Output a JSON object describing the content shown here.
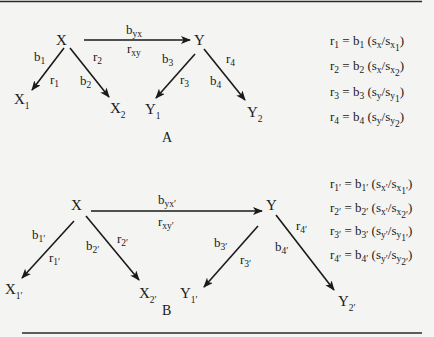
{
  "panels": {
    "A": {
      "caption": "A",
      "nodes": {
        "X": {
          "base": "X",
          "sub": ""
        },
        "Y": {
          "base": "Y",
          "sub": ""
        },
        "X1": {
          "base": "X",
          "sub": "1"
        },
        "X2": {
          "base": "X",
          "sub": "2"
        },
        "Y1": {
          "base": "Y",
          "sub": "1"
        },
        "Y2": {
          "base": "Y",
          "sub": "2"
        }
      },
      "edges": {
        "byx": {
          "base": "b",
          "sub": "yx"
        },
        "rxy": {
          "base": "r",
          "sub": "xy"
        },
        "b1": {
          "base": "b",
          "sub": "1"
        },
        "r1": {
          "base": "r",
          "sub": "1"
        },
        "b2": {
          "base": "b",
          "sub": "2"
        },
        "r2": {
          "base": "r",
          "sub": "2"
        },
        "b3": {
          "base": "b",
          "sub": "3"
        },
        "r3": {
          "base": "r",
          "sub": "3"
        },
        "b4": {
          "base": "b",
          "sub": "4"
        },
        "r4": {
          "base": "r",
          "sub": "4"
        }
      },
      "equations": [
        {
          "r": "r",
          "rs": "1",
          "eq": " = b",
          "bs": "1",
          "open": " (s",
          "ns": "x",
          "slash": "/s",
          "ds": "x",
          "dss": "1",
          "close": ")"
        },
        {
          "r": "r",
          "rs": "2",
          "eq": " = b",
          "bs": "2",
          "open": " (s",
          "ns": "x",
          "slash": "/s",
          "ds": "x",
          "dss": "2",
          "close": ")"
        },
        {
          "r": "r",
          "rs": "3",
          "eq": " = b",
          "bs": "3",
          "open": " (s",
          "ns": "y",
          "slash": "/s",
          "ds": "y",
          "dss": "1",
          "close": ")"
        },
        {
          "r": "r",
          "rs": "4",
          "eq": " = b",
          "bs": "4",
          "open": " (s",
          "ns": "y",
          "slash": "/s",
          "ds": "y",
          "dss": "2",
          "close": ")"
        }
      ]
    },
    "B": {
      "caption": "B",
      "nodes": {
        "X": {
          "base": "X",
          "sub": ""
        },
        "Y": {
          "base": "Y",
          "sub": ""
        },
        "X1": {
          "base": "X",
          "sub": "1′"
        },
        "X2": {
          "base": "X",
          "sub": "2′"
        },
        "Y1": {
          "base": "Y",
          "sub": "1′"
        },
        "Y2": {
          "base": "Y",
          "sub": "2′"
        }
      },
      "edges": {
        "byx": {
          "base": "b",
          "sub": "yx′"
        },
        "rxy": {
          "base": "r",
          "sub": "xy′"
        },
        "b1": {
          "base": "b",
          "sub": "1′"
        },
        "r1": {
          "base": "r",
          "sub": "1′"
        },
        "b2": {
          "base": "b",
          "sub": "2′"
        },
        "r2": {
          "base": "r",
          "sub": "2′"
        },
        "b3": {
          "base": "b",
          "sub": "3′"
        },
        "r3": {
          "base": "r",
          "sub": "3′"
        },
        "b4": {
          "base": "b",
          "sub": "4′"
        },
        "r4": {
          "base": "r",
          "sub": "4′"
        }
      },
      "equations": [
        {
          "r": "r",
          "rs": "1′",
          "eq": " = b",
          "bs": "1′",
          "open": " (s",
          "ns": "x′",
          "slash": "/s",
          "ds": "x",
          "dss": "1′",
          "close": ")"
        },
        {
          "r": "r",
          "rs": "2′",
          "eq": " = b",
          "bs": "2′",
          "open": " (s",
          "ns": "x′",
          "slash": "/s",
          "ds": "x",
          "dss": "2′",
          "close": ")"
        },
        {
          "r": "r",
          "rs": "3′",
          "eq": " = b",
          "bs": "3′",
          "open": " (s",
          "ns": "y′",
          "slash": "/s",
          "ds": "y",
          "dss": "1′",
          "close": ")"
        },
        {
          "r": "r",
          "rs": "4′",
          "eq": " = b",
          "bs": "4′",
          "open": " (s",
          "ns": "y′",
          "slash": "/s",
          "ds": "y",
          "dss": "2′",
          "close": ")"
        }
      ]
    }
  },
  "colors": {
    "ink": "#1a1a1a",
    "paper": "#f4f4f2"
  }
}
